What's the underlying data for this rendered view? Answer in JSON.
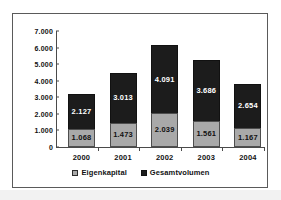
{
  "chart_data": {
    "type": "bar",
    "stacked": true,
    "title": "",
    "subtitle": "",
    "xlabel": "",
    "ylabel": "",
    "categories": [
      "2000",
      "2001",
      "2002",
      "2003",
      "2004"
    ],
    "ylim": [
      0,
      7000
    ],
    "ytick_labels": [
      "7.000",
      "6.000",
      "5.000",
      "4.000",
      "3.000",
      "2.000",
      "1.000",
      "0"
    ],
    "ytick_values": [
      7000,
      6000,
      5000,
      4000,
      3000,
      2000,
      1000,
      0
    ],
    "grid": false,
    "legend_position": "bottom",
    "series": [
      {
        "name": "Eigenkapital",
        "color": "#a9a9a9",
        "values": [
          1068,
          1473,
          2039,
          1561,
          1167
        ],
        "value_labels": [
          "1.068",
          "1.473",
          "2.039",
          "1.561",
          "1.167"
        ]
      },
      {
        "name": "Gesamtvolumen",
        "color": "#1c1c1c",
        "values": [
          2127,
          3013,
          4091,
          3686,
          2654
        ],
        "value_labels": [
          "2.127",
          "3.013",
          "4.091",
          "3.686",
          "2.654"
        ]
      }
    ],
    "totals": [
      3195,
      4486,
      6130,
      5247,
      3821
    ]
  },
  "legend": {
    "items": [
      {
        "label": "Eigenkapital",
        "swatch": "equity-swatch"
      },
      {
        "label": "Gesamtvolumen",
        "swatch": "total-swatch"
      }
    ]
  }
}
